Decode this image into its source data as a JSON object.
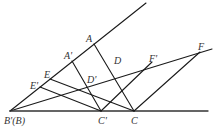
{
  "diagram": {
    "type": "geometry",
    "stroke_color": "#1a1a1a",
    "points": {
      "B": {
        "label": "B'(B)",
        "x": 10,
        "y": 111
      },
      "A": {
        "label": "A",
        "x": 94,
        "y": 44
      },
      "A_prime": {
        "label": "A'",
        "x": 72,
        "y": 61
      },
      "D": {
        "label": "D",
        "x": 114,
        "y": 67
      },
      "D_prime": {
        "label": "D'",
        "x": 89,
        "y": 75
      },
      "E": {
        "label": "E",
        "x": 50,
        "y": 79
      },
      "E_prime": {
        "label": "E'",
        "x": 40,
        "y": 87
      },
      "C": {
        "label": "C",
        "x": 134,
        "y": 111
      },
      "C_prime": {
        "label": "C'",
        "x": 101,
        "y": 111
      },
      "F": {
        "label": "F",
        "x": 200,
        "y": 52
      },
      "F_prime": {
        "label": "F'",
        "x": 152,
        "y": 62
      }
    },
    "segments": [
      {
        "name": "ray-upper",
        "from": "B",
        "to": [
          146,
          3
        ]
      },
      {
        "name": "ray-middle",
        "from": "B",
        "to": [
          212,
          49
        ]
      },
      {
        "name": "baseline",
        "from": "B",
        "to": [
          208,
          111
        ]
      },
      {
        "name": "segment-AC",
        "from": "A",
        "to": "C"
      },
      {
        "name": "segment-A'C'",
        "from": "A_prime",
        "to": "C_prime"
      },
      {
        "name": "segment-EC",
        "from": "E",
        "to": "C"
      },
      {
        "name": "segment-E'C'",
        "from": "E_prime",
        "to": "C_prime"
      },
      {
        "name": "segment-CF",
        "from": "C",
        "to": "F"
      },
      {
        "name": "segment-C'F'",
        "from": "C_prime",
        "to": "F_prime"
      }
    ]
  },
  "labels": {
    "A": "A",
    "A_prime": "A'",
    "D": "D",
    "D_prime": "D'",
    "E": "E",
    "E_prime": "E'",
    "F": "F",
    "F_prime": "F'",
    "B": "B'(B)",
    "C": "C",
    "C_prime": "C'"
  }
}
